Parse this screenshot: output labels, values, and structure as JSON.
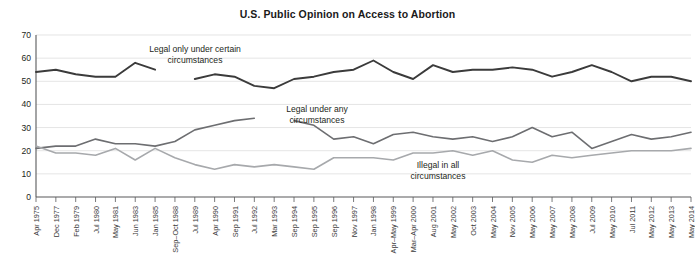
{
  "chart_data": {
    "type": "line",
    "title": "U.S. Public Opinion on Access to Abortion",
    "xlabel": "",
    "ylabel": "",
    "ylim": [
      0,
      70
    ],
    "ytick_step": 10,
    "yticks": [
      0,
      10,
      20,
      30,
      40,
      50,
      60,
      70
    ],
    "grid": true,
    "legend_position": "inline-annotations",
    "categories": [
      "Apr 1975",
      "Dec 1977",
      "Feb 1979",
      "Jul 1980",
      "May 1981",
      "Jun 1983",
      "Jan 1985",
      "Sep–Oct 1988",
      "Jul 1989",
      "Apr 1990",
      "Sep 1991",
      "Jul 1992",
      "Mar 1993",
      "Sep 1994",
      "Sep 1995",
      "Sep 1996",
      "Nov 1997",
      "Jan 1998",
      "Apr–May 1999",
      "Mar–Apr 2000",
      "Aug 2001",
      "May 2002",
      "Oct 2003",
      "May 2004",
      "Nov 2005",
      "May 2006",
      "May 2007",
      "May 2008",
      "Jul 2009",
      "May 2010",
      "Jul 2011",
      "May 2012",
      "May 2013",
      "May 2014"
    ],
    "series": [
      {
        "name": "Legal only under certain circumstances",
        "color": "#3b3b3b",
        "values": [
          54,
          55,
          53,
          52,
          52,
          58,
          55,
          null,
          51,
          53,
          52,
          48,
          47,
          51,
          52,
          54,
          55,
          59,
          54,
          51,
          57,
          54,
          55,
          55,
          56,
          55,
          52,
          54,
          57,
          54,
          50,
          52,
          52,
          50
        ]
      },
      {
        "name": "Legal under any circumstances",
        "color": "#6d6e71",
        "values": [
          21,
          22,
          22,
          25,
          23,
          23,
          22,
          24,
          29,
          31,
          33,
          34,
          null,
          33,
          31,
          25,
          26,
          23,
          27,
          28,
          26,
          25,
          26,
          24,
          26,
          30,
          26,
          28,
          21,
          24,
          27,
          25,
          26,
          28
        ]
      },
      {
        "name": "Illegal in all circumstances",
        "color": "#a7a9ac",
        "values": [
          22,
          19,
          19,
          18,
          21,
          16,
          21,
          17,
          14,
          12,
          14,
          13,
          14,
          13,
          12,
          17,
          17,
          17,
          16,
          19,
          19,
          20,
          18,
          20,
          16,
          15,
          18,
          17,
          18,
          19,
          20,
          20,
          20,
          21
        ]
      }
    ],
    "annotations": [
      {
        "text_line1": "Legal only under certain",
        "text_line2": "circumstances"
      },
      {
        "text_line1": "Legal under any",
        "text_line2": "circumstances"
      },
      {
        "text_line1": "Illegal in all",
        "text_line2": "circumstances"
      }
    ]
  }
}
